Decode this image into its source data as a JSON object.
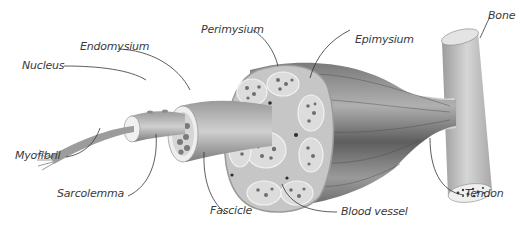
{
  "diagram": {
    "labels": {
      "nucleus": "Nucleus",
      "endomysium": "Endomysium",
      "perimysium": "Perimysium",
      "epimysium": "Epimysium",
      "bone": "Bone",
      "myofibril": "Myofibril",
      "sarcolemma": "Sarcolemma",
      "fascicle": "Fascicle",
      "blood_vessel": "Blood vessel",
      "tendon": "Tendon"
    },
    "colors": {
      "muscle_dark": "#5a5a5a",
      "muscle_mid": "#8c8c8c",
      "muscle_light": "#c8c8c8",
      "sheath": "#d9d9d9",
      "bone": "#bdbdbd",
      "label_text": "#3a3a3a",
      "leader_line": "#333333"
    }
  }
}
